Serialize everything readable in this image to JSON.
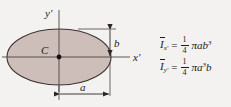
{
  "figure": {
    "shape_name": "ellipse",
    "fill_color": "#cdbeba",
    "stroke_color": "#3a3230",
    "background_color": "#f4f2f0",
    "centroid_label": "C",
    "axis_x_label": "x'",
    "axis_y_label": "y'",
    "dimension_a_label": "a",
    "dimension_b_label": "b"
  },
  "equations": [
    {
      "symbol": "I",
      "subscript": "x'",
      "equals": "=",
      "fraction_numerator": "1",
      "fraction_denominator": "4",
      "expression": "πab",
      "exponent": "3"
    },
    {
      "symbol": "I",
      "subscript": "y'",
      "equals": "=",
      "fraction_numerator": "1",
      "fraction_denominator": "4",
      "expression_pre": "πa",
      "exponent": "3",
      "expression_post": "b"
    }
  ]
}
